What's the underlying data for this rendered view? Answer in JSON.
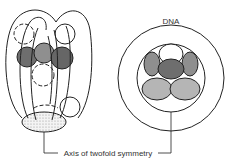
{
  "diagram": {
    "labels": {
      "dna": "DNA",
      "axis": "Axis of twofold symmetry"
    },
    "colors": {
      "stroke": "#222222",
      "dark_gray": "#6e6e6e",
      "mid_gray": "#8f8f8f",
      "light_gray": "#b5b5b5",
      "stipple": "#d8d8d8"
    }
  }
}
